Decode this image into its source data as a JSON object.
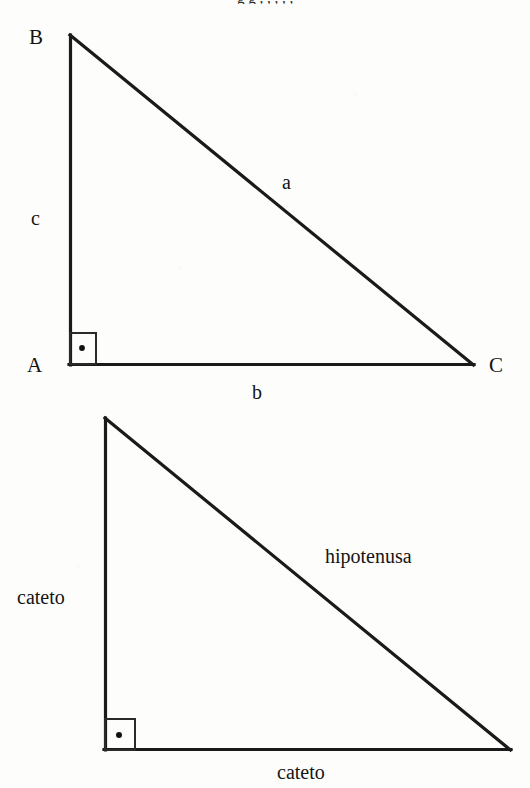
{
  "page": {
    "background_color": "#fdfdfc",
    "ink_color": "#1a1a1a",
    "clipped_header_text": "g g , , , , ,"
  },
  "figures": [
    {
      "id": "triangle-abc",
      "name": "right-triangle-abc",
      "vertices": {
        "B": {
          "x": 70,
          "y": 35,
          "label": "B"
        },
        "A": {
          "x": 70,
          "y": 365,
          "label": "A"
        },
        "C": {
          "x": 473,
          "y": 365,
          "label": "C"
        }
      },
      "right_angle_at": "A",
      "side_labels": {
        "vertical_leg": "c",
        "horizontal_leg": "b",
        "hypotenuse": "a"
      }
    },
    {
      "id": "triangle-cateto-hipotenusa",
      "name": "right-triangle-named-sides",
      "vertices": {
        "top": {
          "x": 105,
          "y": 418
        },
        "corner": {
          "x": 105,
          "y": 750
        },
        "right": {
          "x": 510,
          "y": 750
        }
      },
      "right_angle_at": "corner",
      "side_labels": {
        "vertical_leg": "cateto",
        "horizontal_leg": "cateto",
        "hypotenuse": "hipotenusa"
      }
    }
  ],
  "markers": {
    "right_angle_symbol": "square-with-dot"
  }
}
